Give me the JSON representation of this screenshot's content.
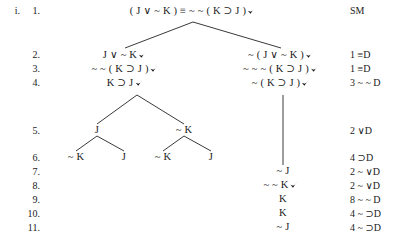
{
  "document": {
    "type": "truth-tree",
    "tree_label": "i.",
    "header_justification": "SM"
  },
  "line_numbers": [
    "1.",
    "2.",
    "3.",
    "4.",
    "5.",
    "6.",
    "7.",
    "8.",
    "9.",
    "10.",
    "11."
  ],
  "nodes": [
    {
      "id": "n1",
      "line": 1,
      "text": "( J ∨ ~ K )  ≡  ~ ~ ( K ⊃ J )",
      "checked": true,
      "x": 193,
      "y": 11
    },
    {
      "id": "n2L",
      "line": 2,
      "text": "J ∨ ~ K",
      "checked": true,
      "x": 125,
      "y": 55
    },
    {
      "id": "n2R",
      "line": 2,
      "text": "~ ( J ∨ ~ K )",
      "checked": true,
      "x": 281,
      "y": 55
    },
    {
      "id": "n3L",
      "line": 3,
      "text": "~ ~ ( K ⊃ J )",
      "checked": true,
      "x": 125,
      "y": 69
    },
    {
      "id": "n3R",
      "line": 3,
      "text": "~ ~ ~ ( K ⊃ J )",
      "checked": true,
      "x": 281,
      "y": 69
    },
    {
      "id": "n4L",
      "line": 4,
      "text": "K ⊃ J",
      "checked": true,
      "x": 125,
      "y": 83
    },
    {
      "id": "n4R",
      "line": 4,
      "text": "~ ( K ⊃ J )",
      "checked": true,
      "x": 281,
      "y": 83
    },
    {
      "id": "n5L",
      "line": 5,
      "text": "J",
      "checked": false,
      "x": 97,
      "y": 131
    },
    {
      "id": "n5R",
      "line": 5,
      "text": "~ K",
      "checked": false,
      "x": 184,
      "y": 131
    },
    {
      "id": "n6a",
      "line": 6,
      "text": "~ K",
      "checked": false,
      "x": 76,
      "y": 158
    },
    {
      "id": "n6b",
      "line": 6,
      "text": "J",
      "checked": false,
      "x": 124,
      "y": 158
    },
    {
      "id": "n6c",
      "line": 6,
      "text": "~ K",
      "checked": false,
      "x": 163,
      "y": 158
    },
    {
      "id": "n6d",
      "line": 6,
      "text": "J",
      "checked": false,
      "x": 211,
      "y": 158
    },
    {
      "id": "n7",
      "line": 7,
      "text": "~ J",
      "checked": false,
      "x": 283,
      "y": 172
    },
    {
      "id": "n8",
      "line": 8,
      "text": "~ ~ K",
      "checked": true,
      "x": 281,
      "y": 186
    },
    {
      "id": "n9",
      "line": 9,
      "text": "K",
      "checked": false,
      "x": 283,
      "y": 200
    },
    {
      "id": "n10",
      "line": 10,
      "text": "K",
      "checked": false,
      "x": 283,
      "y": 214
    },
    {
      "id": "n11",
      "line": 11,
      "text": "~ J",
      "checked": false,
      "x": 283,
      "y": 228
    }
  ],
  "justifications": [
    {
      "line": 1,
      "text": "SM",
      "y": 11
    },
    {
      "line": 2,
      "text": "1 ≡D",
      "y": 55
    },
    {
      "line": 3,
      "text": "1 ≡D",
      "y": 69
    },
    {
      "line": 4,
      "text": "3 ~ ~ D",
      "y": 83
    },
    {
      "line": 5,
      "text": "2 ∨D",
      "y": 131
    },
    {
      "line": 6,
      "text": "4 ⊃D",
      "y": 158
    },
    {
      "line": 7,
      "text": "2 ~ ∨D",
      "y": 172
    },
    {
      "line": 8,
      "text": "2 ~ ∨D",
      "y": 186
    },
    {
      "line": 9,
      "text": "8 ~ ~ D",
      "y": 200
    },
    {
      "line": 10,
      "text": "4 ~ ⊃D",
      "y": 214
    },
    {
      "line": 11,
      "text": "4 ~ ⊃D",
      "y": 228
    }
  ],
  "branch_lines": [
    {
      "name": "root-to-left-branch",
      "x1": 193,
      "y1": 22,
      "x2": 125,
      "y2": 48
    },
    {
      "name": "root-to-right-branch",
      "x1": 193,
      "y1": 22,
      "x2": 281,
      "y2": 48
    },
    {
      "name": "left-to-j",
      "x1": 137,
      "y1": 95,
      "x2": 97,
      "y2": 124
    },
    {
      "name": "left-to-notk",
      "x1": 137,
      "y1": 95,
      "x2": 184,
      "y2": 124
    },
    {
      "name": "j-to-notk",
      "x1": 97,
      "y1": 136,
      "x2": 76,
      "y2": 151
    },
    {
      "name": "j-to-j",
      "x1": 97,
      "y1": 136,
      "x2": 124,
      "y2": 151
    },
    {
      "name": "notk-to-notk",
      "x1": 184,
      "y1": 136,
      "x2": 163,
      "y2": 151
    },
    {
      "name": "notk-to-j",
      "x1": 184,
      "y1": 136,
      "x2": 211,
      "y2": 151
    },
    {
      "name": "right-trunk",
      "x1": 283,
      "y1": 95,
      "x2": 283,
      "y2": 165
    }
  ],
  "columns": {
    "tree_label_x": 10,
    "line_number_x": 30,
    "justification_x": 350
  }
}
